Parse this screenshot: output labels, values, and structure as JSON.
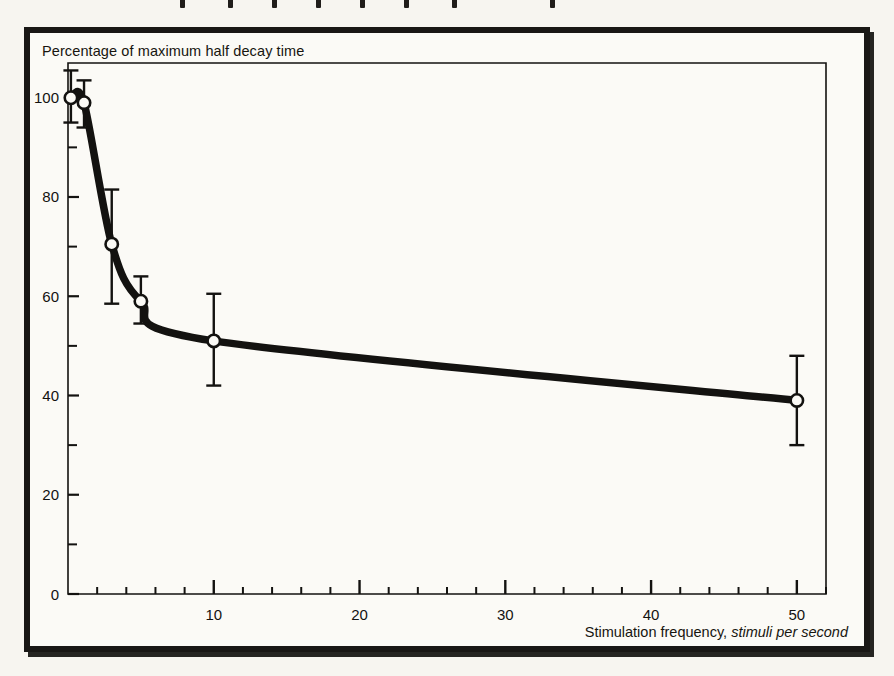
{
  "figure": {
    "title": "Percentage of maximum half decay time",
    "xaxis_label_plain": "Stimulation frequency,",
    "xaxis_label_italic": "stimuli per second",
    "frame_color": "#191715",
    "background_color": "#fbfaf6",
    "ink_color": "#131210"
  },
  "chart_data": {
    "type": "line",
    "title": "Percentage of maximum half decay time",
    "xlabel": "Stimulation frequency, stimuli per second",
    "ylabel": "Percentage of maximum half decay time",
    "xlim": [
      0,
      52
    ],
    "ylim": [
      0,
      107
    ],
    "grid": false,
    "legend": "none",
    "x_major_ticks": [
      10,
      20,
      30,
      40,
      50
    ],
    "x_major_tick_labels": [
      "10",
      "20",
      "30",
      "40",
      "50"
    ],
    "x_minor_tick_step": 2,
    "y_major_ticks": [
      0,
      20,
      40,
      60,
      80,
      100
    ],
    "y_major_tick_labels": [
      "0",
      "20",
      "40",
      "60",
      "80",
      "100"
    ],
    "y_minor_ticks": [
      10,
      30,
      50,
      70,
      90
    ],
    "marker": "open-circle",
    "error_bars": "vertical",
    "series": [
      {
        "name": "half decay time",
        "x": [
          0.2,
          1.1,
          3.0,
          5.0,
          10.0,
          50.0
        ],
        "values": [
          100.0,
          99.0,
          70.5,
          59.0,
          51.0,
          39.0
        ],
        "err_low": [
          5.0,
          5.0,
          12.0,
          4.5,
          9.0,
          9.0
        ],
        "err_high": [
          5.5,
          4.5,
          11.0,
          5.0,
          9.5,
          9.0
        ]
      }
    ]
  }
}
